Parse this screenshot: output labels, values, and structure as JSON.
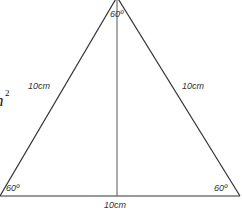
{
  "diagram": {
    "colors": {
      "stroke": "#333333",
      "altitude": "#555555",
      "text": "#333333"
    },
    "angles": {
      "top": "60º",
      "bottom_left": "60º",
      "bottom_right": "60º"
    },
    "sides": {
      "left": "10cm",
      "right": "10cm",
      "base": "10cm"
    },
    "partial_formula": {
      "text": "n",
      "superscript": "2"
    }
  }
}
